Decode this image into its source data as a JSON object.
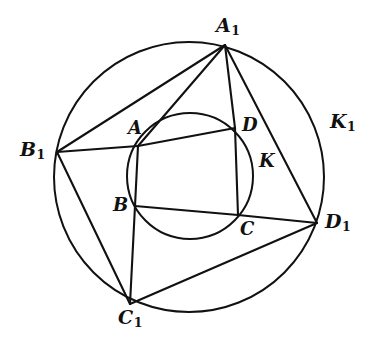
{
  "figure": {
    "stroke_color": "#111111",
    "background_color": "#ffffff"
  },
  "chart_data": {
    "type": "diagram",
    "title": "",
    "circles": [
      {
        "name": "K",
        "label": "K",
        "cx": 190,
        "cy": 176,
        "r": 63,
        "stroke": "#111111",
        "stroke_width": 2.0
      },
      {
        "name": "K1",
        "label": "K1",
        "cx": 189,
        "cy": 177,
        "r": 135,
        "stroke": "#111111",
        "stroke_width": 2.0
      }
    ],
    "points": [
      {
        "id": "A",
        "label": "A",
        "x": 138,
        "y": 146,
        "on": "K"
      },
      {
        "id": "B",
        "label": "B",
        "x": 135,
        "y": 206,
        "on": "K"
      },
      {
        "id": "C",
        "label": "C",
        "x": 238,
        "y": 215,
        "on": "K"
      },
      {
        "id": "D",
        "label": "D",
        "x": 235,
        "y": 128,
        "on": "K"
      },
      {
        "id": "A1",
        "label": "A1",
        "x": 225,
        "y": 45,
        "on": "K1"
      },
      {
        "id": "B1",
        "label": "B1",
        "x": 57,
        "y": 152,
        "on": "K1"
      },
      {
        "id": "C1",
        "label": "C1",
        "x": 130,
        "y": 304,
        "on": "K1"
      },
      {
        "id": "D1",
        "label": "D1",
        "x": 317,
        "y": 223,
        "on": "K1"
      }
    ],
    "segments": [
      {
        "from": "A1",
        "to": "B1",
        "passes_through": [
          "A"
        ]
      },
      {
        "from": "A1",
        "to": "C1",
        "passes_through": [
          "D_vertical",
          "C",
          "B"
        ]
      },
      {
        "from": "A1",
        "to": "D1",
        "passes_through": []
      },
      {
        "from": "B1",
        "to": "D",
        "passes_through": [
          "A"
        ]
      },
      {
        "from": "B1",
        "to": "C1",
        "passes_through": []
      },
      {
        "from": "B",
        "to": "D1",
        "passes_through": [
          "C"
        ]
      },
      {
        "from": "C1",
        "to": "D1",
        "passes_through": []
      }
    ]
  },
  "labels": {
    "A": {
      "text": "A",
      "x": 128,
      "y": 119
    },
    "B": {
      "text": "B",
      "x": 113,
      "y": 196
    },
    "C": {
      "text": "C",
      "x": 240,
      "y": 220
    },
    "D": {
      "text": "D",
      "x": 242,
      "y": 116
    },
    "K": {
      "text": "K",
      "x": 259,
      "y": 152
    },
    "A1": {
      "base": "A",
      "sub": "1",
      "x": 216,
      "y": 16
    },
    "B1": {
      "base": "B",
      "sub": "1",
      "x": 20,
      "y": 140
    },
    "C1": {
      "base": "C",
      "sub": "1",
      "x": 118,
      "y": 308
    },
    "D1": {
      "base": "D",
      "sub": "1",
      "x": 325,
      "y": 212
    },
    "K1": {
      "base": "K",
      "sub": "1",
      "x": 330,
      "y": 112
    }
  }
}
